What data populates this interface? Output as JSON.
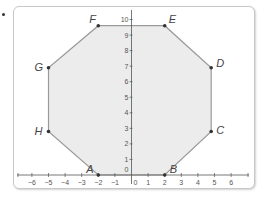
{
  "figure": {
    "type": "coordinate-plane-polygon",
    "shape": "octagon",
    "fill_color": "#ececec",
    "edge_color": "#9a9a9a",
    "vertex_color": "#333333",
    "axis_color": "#555555"
  },
  "axes": {
    "x_ticks": [
      "−6",
      "−5",
      "−4",
      "−3",
      "−2",
      "−1",
      "0",
      "1",
      "2",
      "3",
      "4",
      "5",
      "6"
    ],
    "x_values": [
      -6,
      -5,
      -4,
      -3,
      -2,
      -1,
      0,
      1,
      2,
      3,
      4,
      5,
      6
    ],
    "y_ticks": [
      "0",
      "1",
      "2",
      "3",
      "4",
      "5",
      "6",
      "7",
      "8",
      "9",
      "10"
    ],
    "y_values": [
      0,
      1,
      2,
      3,
      4,
      5,
      6,
      7,
      8,
      9,
      10
    ]
  },
  "vertices": [
    {
      "label": "A",
      "x": -2,
      "y": 0
    },
    {
      "label": "B",
      "x": 2,
      "y": 0
    },
    {
      "label": "C",
      "x": 4.8,
      "y": 2.8
    },
    {
      "label": "D",
      "x": 4.8,
      "y": 6.9
    },
    {
      "label": "E",
      "x": 2,
      "y": 9.6
    },
    {
      "label": "F",
      "x": -2,
      "y": 9.6
    },
    {
      "label": "G",
      "x": -5,
      "y": 6.9
    },
    {
      "label": "H",
      "x": -5,
      "y": 2.8
    }
  ]
}
